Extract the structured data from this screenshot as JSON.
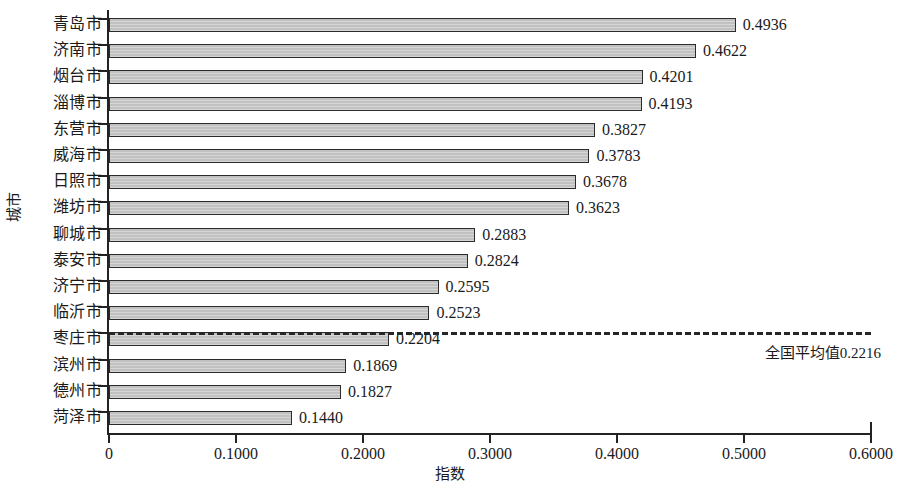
{
  "chart_data": {
    "type": "bar",
    "orientation": "horizontal",
    "title": "",
    "xlabel": "指数",
    "ylabel": "城市",
    "xlim": [
      0,
      0.6
    ],
    "grid": false,
    "legend": false,
    "xticks": [
      "0",
      "0.1000",
      "0.2000",
      "0.3000",
      "0.4000",
      "0.5000",
      "0.6000"
    ],
    "xtick_values": [
      0,
      0.1,
      0.2,
      0.3,
      0.4,
      0.5,
      0.6
    ],
    "categories": [
      "青岛市",
      "济南市",
      "烟台市",
      "淄博市",
      "东营市",
      "威海市",
      "日照市",
      "潍坊市",
      "聊城市",
      "泰安市",
      "济宁市",
      "临沂市",
      "枣庄市",
      "滨州市",
      "德州市",
      "菏泽市"
    ],
    "values": [
      0.4936,
      0.4622,
      0.4201,
      0.4193,
      0.3827,
      0.3783,
      0.3678,
      0.3623,
      0.2883,
      0.2824,
      0.2595,
      0.2523,
      0.2204,
      0.1869,
      0.1827,
      0.144
    ],
    "value_labels": [
      "0.4936",
      "0.4622",
      "0.4201",
      "0.4193",
      "0.3827",
      "0.3783",
      "0.3678",
      "0.3623",
      "0.2883",
      "0.2824",
      "0.2595",
      "0.2523",
      "0.2204",
      "0.1869",
      "0.1827",
      "0.1440"
    ],
    "annotations": [
      {
        "name": "national-average",
        "text": "全国平均值0.2216",
        "value": 0.2216,
        "style": "dashed-horizontal-line"
      }
    ],
    "bar_fill_color": "#c6c6c6",
    "bar_edge_color": "#2b2b2b"
  }
}
